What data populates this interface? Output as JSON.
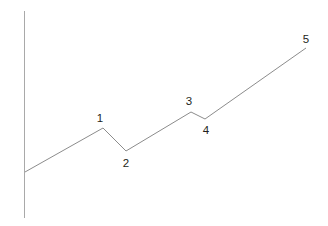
{
  "figure": {
    "background_color": "#ffffff",
    "width": 328,
    "height": 226
  },
  "axis": {
    "name": "vertical-axis",
    "color": "#a9a9a9",
    "x": 24.5,
    "y_top": 11,
    "y_bottom": 218
  },
  "chart_data": {
    "type": "line",
    "title": "",
    "subtitle": "",
    "xlabel": "",
    "ylabel": "",
    "grid": false,
    "legend": null,
    "line_color": "#8c8c8c",
    "label_color": "#231f20",
    "xlim": [
      0,
      328
    ],
    "ylim": [
      226,
      0
    ],
    "annotations": [
      "1",
      "2",
      "3",
      "4",
      "5"
    ],
    "points": [
      {
        "label": "",
        "x": 25,
        "y": 172,
        "label_x": 0,
        "label_y": 0
      },
      {
        "label": "1",
        "x": 103,
        "y": 128,
        "label_x": 100,
        "label_y": 118
      },
      {
        "label": "2",
        "x": 126,
        "y": 151,
        "label_x": 126,
        "label_y": 163
      },
      {
        "label": "3",
        "x": 191,
        "y": 112,
        "label_x": 189,
        "label_y": 101
      },
      {
        "label": "4",
        "x": 205,
        "y": 119,
        "label_x": 206,
        "label_y": 130
      },
      {
        "label": "5",
        "x": 306,
        "y": 48,
        "label_x": 306,
        "label_y": 39
      }
    ],
    "x": [
      25,
      103,
      126,
      191,
      205,
      306
    ],
    "values": [
      172,
      128,
      151,
      112,
      119,
      48
    ]
  }
}
